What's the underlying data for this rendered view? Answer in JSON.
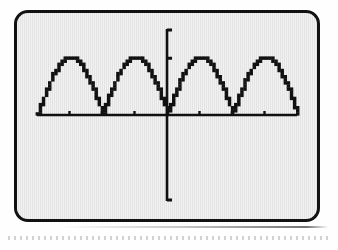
{
  "figure": {
    "kind": "graphing-calculator-screen",
    "device_style": "ti-graphing-calculator",
    "screen_background": "#e3e3e3",
    "ink_color": "#111111",
    "bezel_color": "#111111"
  },
  "chart_data": {
    "type": "line",
    "title": "",
    "subtitle": "",
    "xlabel": "",
    "ylabel": "",
    "grid": false,
    "legend_position": "none",
    "axis_style": "calculator-crosshair",
    "pixelated": true,
    "xlim": [
      -6.283185,
      6.283185
    ],
    "ylim": [
      -1.55,
      1.55
    ],
    "x_tick_count": 8,
    "x_tick_spacing_units": 1.570796,
    "y_tick_count": 2,
    "y_tick_spacing_units": 1.0,
    "x_ticks": [
      -4.712389,
      -3.141593,
      -1.570796,
      1.570796,
      3.141593,
      4.712389
    ],
    "y_ticks": [
      1.0
    ],
    "tick_labels_shown": false,
    "series": [
      {
        "name": "y = |sin x|",
        "color": "#111111",
        "x": [
          -6.283185,
          -6.086836,
          -5.890486,
          -5.694137,
          -5.497787,
          -5.301438,
          -5.105088,
          -4.908739,
          -4.712389,
          -4.516039,
          -4.31969,
          -4.12334,
          -3.926991,
          -3.730641,
          -3.534292,
          -3.337942,
          -3.141593,
          -2.945243,
          -2.748894,
          -2.552544,
          -2.356194,
          -2.159845,
          -1.963495,
          -1.767146,
          -1.570796,
          -1.374447,
          -1.178097,
          -0.981748,
          -0.785398,
          -0.589049,
          -0.392699,
          -0.19635,
          0.0,
          0.19635,
          0.392699,
          0.589049,
          0.785398,
          0.981748,
          1.178097,
          1.374447,
          1.570796,
          1.767146,
          1.963495,
          2.159845,
          2.356194,
          2.552544,
          2.748894,
          2.945243,
          3.141593,
          3.337942,
          3.534292,
          3.730641,
          3.926991,
          4.12334,
          4.31969,
          4.516039,
          4.712389,
          4.908739,
          5.105088,
          5.301438,
          5.497787,
          5.694137,
          5.890486,
          6.086836,
          6.283185
        ],
        "y": [
          0.0,
          0.195,
          0.383,
          0.556,
          0.707,
          0.831,
          0.924,
          0.981,
          1.0,
          0.981,
          0.924,
          0.831,
          0.707,
          0.556,
          0.383,
          0.195,
          0.0,
          0.195,
          0.383,
          0.556,
          0.707,
          0.831,
          0.924,
          0.981,
          1.0,
          0.981,
          0.924,
          0.831,
          0.707,
          0.556,
          0.383,
          0.195,
          0.0,
          0.195,
          0.383,
          0.556,
          0.707,
          0.831,
          0.924,
          0.981,
          1.0,
          0.981,
          0.924,
          0.831,
          0.707,
          0.556,
          0.383,
          0.195,
          0.0,
          0.195,
          0.383,
          0.556,
          0.707,
          0.831,
          0.924,
          0.981,
          1.0,
          0.981,
          0.924,
          0.831,
          0.707,
          0.556,
          0.383,
          0.195,
          0.0
        ]
      }
    ]
  }
}
